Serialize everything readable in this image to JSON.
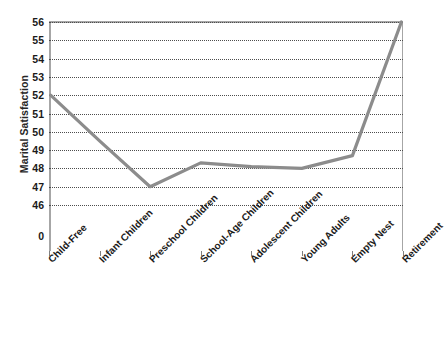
{
  "chart_data": {
    "type": "line",
    "title": "",
    "xlabel": "",
    "ylabel": "Marital Satisfaction",
    "categories": [
      "Child-Free",
      "Infant Children",
      "Preschool Children",
      "School-Age Children",
      "Adolescent Children",
      "Young Adults",
      "Empty Nest",
      "Retirement"
    ],
    "values": [
      52,
      49.5,
      47,
      48.3,
      48.1,
      48,
      48.7,
      56
    ],
    "ylim": [
      46,
      56
    ],
    "yticks": [
      56,
      55,
      54,
      53,
      52,
      51,
      50,
      49,
      48,
      47,
      46,
      0
    ],
    "ytick_labels": [
      "56",
      "55",
      "54",
      "53",
      "52",
      "51",
      "50",
      "49",
      "48",
      "47",
      "46",
      "0"
    ],
    "axis_break": true,
    "grid": true,
    "legend": "none",
    "series": [
      {
        "name": "Marital Satisfaction",
        "values": [
          52,
          49.5,
          47,
          48.3,
          48.1,
          48,
          48.7,
          56
        ],
        "color": "#8c8c8c"
      }
    ],
    "colors": {
      "line": "#8c8c8c",
      "gridline": "#4d4d4d",
      "frame": "#a6a6a6",
      "text": "#1a1a1a",
      "background": "#ffffff"
    }
  }
}
